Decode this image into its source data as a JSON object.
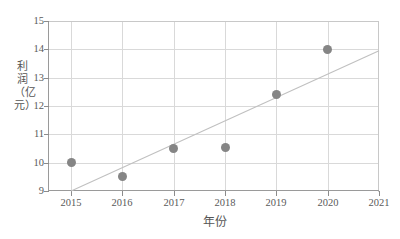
{
  "chart_data": {
    "type": "scatter",
    "title": "",
    "xlabel": "年份",
    "ylabel": "利润（亿元）",
    "x": [
      2015,
      2016,
      2017,
      2018,
      2019,
      2020
    ],
    "values": [
      10.0,
      9.5,
      10.5,
      10.55,
      12.4,
      14.0
    ],
    "series": [
      {
        "name": "利润",
        "x": [
          2015,
          2016,
          2017,
          2018,
          2019,
          2020
        ],
        "values": [
          10.0,
          9.5,
          10.5,
          10.55,
          12.4,
          14.0
        ],
        "marker": "circle",
        "color": "#858585"
      },
      {
        "name": "trend-line",
        "type": "line",
        "x": [
          2015,
          2021
        ],
        "values": [
          9.0,
          13.95
        ],
        "color": "#c0c0c0"
      }
    ],
    "xlim": [
      2014.55,
      2021.0
    ],
    "ylim": [
      9,
      15
    ],
    "xticks": [
      2015,
      2016,
      2017,
      2018,
      2019,
      2020,
      2021
    ],
    "xtick_labels": [
      "2015",
      "2016",
      "2017",
      "2018",
      "2019",
      "2020",
      "2021"
    ],
    "yticks": [
      9,
      10,
      11,
      12,
      13,
      14,
      15
    ],
    "ytick_labels": [
      "9",
      "10",
      "11",
      "12",
      "13",
      "14",
      "15"
    ],
    "grid": true,
    "legend": false,
    "legend_position": "none",
    "annotations": []
  },
  "colors": {
    "marker": "#858585",
    "trend": "#c0c0c0",
    "grid": "#d9d9d9",
    "axis": "#9a9a9a",
    "text": "#5a5a5a",
    "background": "#ffffff"
  }
}
